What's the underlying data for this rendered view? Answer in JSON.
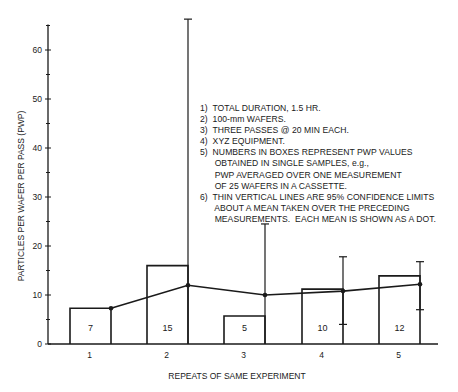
{
  "chart_data": {
    "type": "bar",
    "title": "",
    "xlabel": "REPEATS OF SAME EXPERIMENT",
    "ylabel": "PARTICLES PER WAFER PER PASS (PWP)",
    "categories": [
      "1",
      "2",
      "3",
      "4",
      "5"
    ],
    "ylim": [
      0,
      65
    ],
    "yticks": [
      0,
      10,
      20,
      30,
      40,
      50,
      60
    ],
    "yminor_ticks": [
      5,
      15,
      25,
      35,
      45,
      55,
      65
    ],
    "grid": false,
    "series": [
      {
        "name": "PWP single sample (boxes)",
        "type": "bar",
        "values": [
          7,
          15,
          5,
          10,
          12
        ],
        "bar_heights_plotted": [
          7.3,
          16.0,
          5.7,
          11.2,
          13.9
        ]
      },
      {
        "name": "Running mean (dots)",
        "type": "line",
        "values": [
          7.3,
          12.0,
          10.0,
          10.8,
          12.2
        ]
      },
      {
        "name": "95% confidence limits",
        "type": "errorbar",
        "upper": [
          null,
          66.3,
          24.5,
          17.8,
          16.8
        ],
        "lower": [
          null,
          0,
          0,
          4.0,
          7.0
        ]
      }
    ],
    "annotations": [
      "1) TOTAL DURATION, 1.5 HR.",
      "2) 100-mm WAFERS.",
      "3) THREE PASSES @ 20 MIN EACH.",
      "4) XYZ EQUIPMENT.",
      "5) NUMBERS IN BOXES REPRESENT PWP VALUES OBTAINED IN SINGLE SAMPLES, e.g., PWP AVERAGED OVER ONE MEASUREMENT OF 25 WAFERS IN A CASSETTE.",
      "6) THIN VERTICAL LINES ARE 95% CONFIDENCE LIMITS ABOUT A MEAN TAKEN OVER THE PRECEDING MEASUREMENTS. EACH MEAN IS SHOWN AS A DOT."
    ]
  },
  "notes": [
    "1)  TOTAL DURATION, 1.5 HR.",
    "2)  100-mm WAFERS.",
    "3)  THREE PASSES @ 20 MIN EACH.",
    "4)  XYZ EQUIPMENT.",
    "5)  NUMBERS IN BOXES REPRESENT PWP VALUES",
    "      OBTAINED IN SINGLE SAMPLES, e.g.,",
    "      PWP AVERAGED OVER ONE MEASUREMENT",
    "      OF 25 WAFERS IN A CASSETTE.",
    "6)  THIN VERTICAL LINES ARE 95% CONFIDENCE LIMITS",
    "      ABOUT A MEAN TAKEN OVER THE PRECEDING",
    "      MEASUREMENTS.  EACH MEAN IS SHOWN AS A DOT."
  ],
  "colors": {
    "ink": "#1a1a1a",
    "background": "#ffffff"
  }
}
